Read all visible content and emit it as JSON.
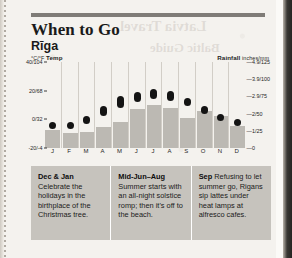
{
  "page": {
    "title": "When to Go",
    "subtitle": "Rīga"
  },
  "chart_data": {
    "type": "bar",
    "subtitle": "Rīga",
    "xlabel": "",
    "grid": false,
    "legend": "none",
    "categories": [
      "J",
      "F",
      "M",
      "A",
      "M",
      "J",
      "J",
      "A",
      "S",
      "O",
      "N",
      "D"
    ],
    "left_axis": {
      "name": "Temp",
      "units": "°C/°F",
      "header_units": "°C/°F",
      "header_name": "Temp",
      "ticks": [
        "40/104",
        "20/68",
        "0/32",
        "-20/-4"
      ],
      "tick_values": [
        40,
        20,
        0,
        -20
      ],
      "ylim": [
        -20,
        40
      ]
    },
    "right_axis": {
      "name": "Rainfall",
      "units": "inches/mm",
      "header_name": "Rainfall",
      "header_units": "inches/mm",
      "ticks": [
        "4.9/125",
        "3.9/100",
        "2.9/75",
        "2/50",
        "1/25",
        "0"
      ],
      "tick_values": [
        125,
        100,
        75,
        50,
        25,
        0
      ],
      "ylim": [
        0,
        125
      ]
    },
    "series": [
      {
        "name": "Temperature range (°C)",
        "type": "range-bar",
        "color": "#141414",
        "low": [
          -6,
          -6,
          -3,
          2,
          8,
          12,
          14,
          13,
          9,
          4,
          0,
          -4
        ],
        "high": [
          -2,
          -2,
          2,
          9,
          16,
          19,
          21,
          20,
          15,
          9,
          4,
          0
        ]
      },
      {
        "name": "Rainfall (mm)",
        "type": "bar",
        "color": "#bcb9b3",
        "values": [
          26,
          22,
          24,
          30,
          38,
          56,
          62,
          58,
          44,
          54,
          46,
          32
        ]
      }
    ]
  },
  "notes": [
    {
      "heading": "Dec & Jan",
      "text": "Celebrate the holidays in the birthplace of the Christmas tree.",
      "inline": false
    },
    {
      "heading": "Mid-Jun–Aug",
      "text": "Summer starts with an all-night solstice romp; then it's off to the beach.",
      "inline": false
    },
    {
      "heading": "Sep",
      "text": "Refusing to let summer go, Rigans sip lattes under heat lamps at alfresco cafes.",
      "inline": true
    }
  ]
}
